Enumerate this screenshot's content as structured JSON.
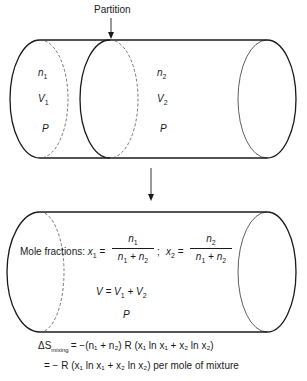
{
  "top_diagram": {
    "partition_label": "Partition",
    "left_chamber": {
      "n": "n",
      "n_sub": "1",
      "V": "V",
      "V_sub": "1",
      "P": "P"
    },
    "right_chamber": {
      "n": "n",
      "n_sub": "2",
      "V": "V",
      "V_sub": "2",
      "P": "P"
    }
  },
  "bottom_diagram": {
    "mole_fractions_label": "Mole fractions:",
    "x1": {
      "lhs": "x",
      "lhs_sub": "1",
      "num": "n",
      "num_sub": "1",
      "den_a": "n",
      "den_a_sub": "1",
      "den_b": "n",
      "den_b_sub": "2"
    },
    "separator": ";",
    "x2": {
      "lhs": "x",
      "lhs_sub": "2",
      "num": "n",
      "num_sub": "2",
      "den_a": "n",
      "den_a_sub": "1",
      "den_b": "n",
      "den_b_sub": "2"
    },
    "volume_eq": {
      "V": "V",
      "V1": "V",
      "V1_sub": "1",
      "V2": "V",
      "V2_sub": "2"
    },
    "P": "P"
  },
  "entropy": {
    "delta": "ΔS",
    "sub": "mixing",
    "line1_rhs": "= −(n₁ + n₂) R (x₁ ln x₁ + x₂ ln x₂)",
    "line2": "= − R (x₁ ln x₁ + x₂ ln x₂) per mole of mixture",
    "per_mole_text": "per mole of mixture"
  },
  "colors": {
    "line": "#1a1a1a",
    "dashed": "#555555",
    "background": "#ffffff"
  }
}
